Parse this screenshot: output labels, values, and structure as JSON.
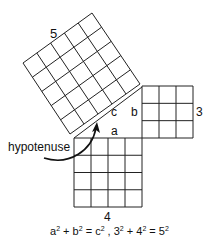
{
  "diagram": {
    "stroke_color": "#222222",
    "background": "#ffffff",
    "squares": [
      {
        "name": "hypotenuse-square",
        "side_label": "5",
        "units": 5,
        "corners": [
          [
            70,
            134
          ],
          [
            140,
            84
          ],
          [
            92,
            13
          ],
          [
            23,
            63
          ]
        ]
      },
      {
        "name": "side-b-square",
        "side_label": "3",
        "units": 3,
        "corners": [
          [
            142,
            138
          ],
          [
            193,
            138
          ],
          [
            193,
            86
          ],
          [
            142,
            86
          ]
        ]
      },
      {
        "name": "side-a-square",
        "side_label": "4",
        "units": 4,
        "corners": [
          [
            74,
            207
          ],
          [
            142,
            207
          ],
          [
            142,
            138
          ],
          [
            74,
            138
          ]
        ]
      }
    ],
    "triangle_labels": {
      "a": "a",
      "b": "b",
      "c": "c"
    },
    "callout": {
      "text": "hypotenuse"
    },
    "formula": {
      "parts": [
        "a",
        "2",
        " + b",
        "2",
        " = c",
        "2",
        " , 3",
        "2",
        " + 4",
        "2",
        " = 5",
        "2"
      ]
    }
  }
}
